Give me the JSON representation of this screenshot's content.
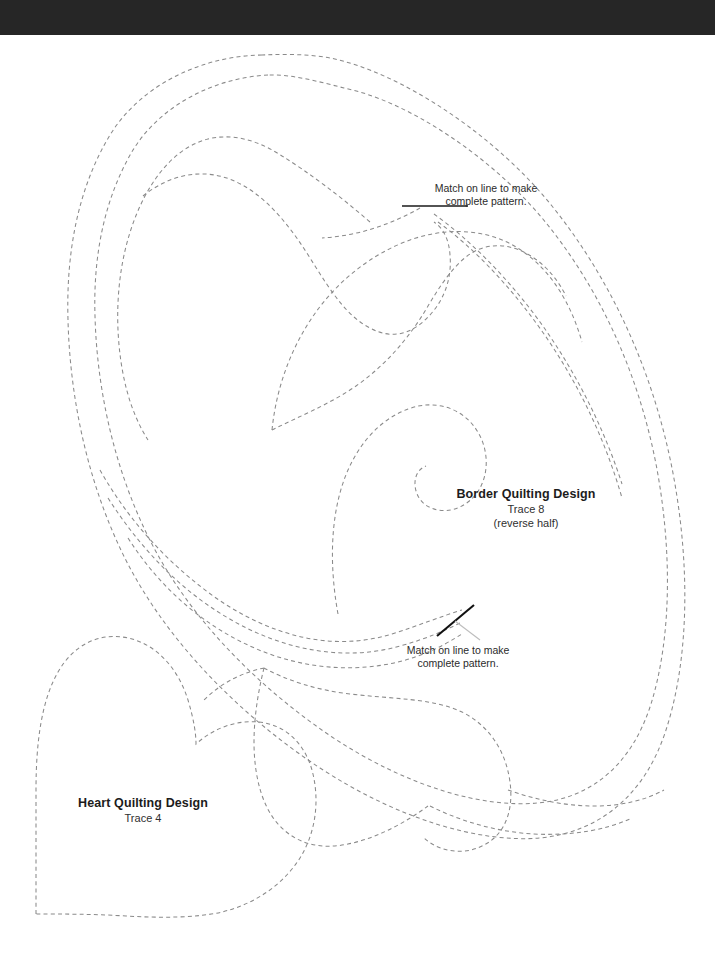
{
  "page": {
    "background_color": "#ffffff",
    "top_band_color": "#262626",
    "line_color": "#8a8a8a",
    "text_color": "#1c1c1c",
    "width": 715,
    "height": 961
  },
  "designs": [
    {
      "id": "border-quilting-design",
      "title": "Border Quilting Design",
      "trace": "Trace 8",
      "note": "(reverse half)"
    },
    {
      "id": "heart-quilting-design",
      "title": "Heart Quilting Design",
      "trace": "Trace 4",
      "note": ""
    }
  ],
  "match_notes": [
    {
      "id": "match-note-top",
      "line1": "Match on line to make",
      "line2": "complete pattern."
    },
    {
      "id": "match-note-bottom",
      "line1": "Match on line to make",
      "line2": "complete pattern."
    }
  ]
}
